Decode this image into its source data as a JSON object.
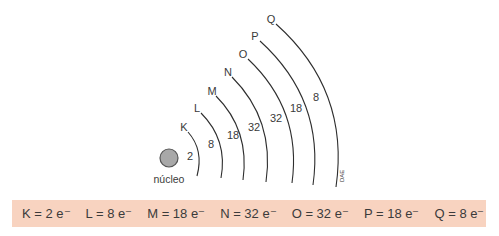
{
  "diagram": {
    "nucleus_label": "núcleo",
    "credit": "DAE",
    "nucleus_color": "#a8a8a8",
    "shells": [
      {
        "letter": "K",
        "electrons": "2"
      },
      {
        "letter": "L",
        "electrons": "8"
      },
      {
        "letter": "M",
        "electrons": "18"
      },
      {
        "letter": "N",
        "electrons": "32"
      },
      {
        "letter": "O",
        "electrons": "32"
      },
      {
        "letter": "P",
        "electrons": "18"
      },
      {
        "letter": "Q",
        "electrons": "8"
      }
    ]
  },
  "legend_strip": {
    "background": "#f8d3c0",
    "items": [
      "K = 2 e⁻",
      "L = 8 e⁻",
      "M = 18 e⁻",
      "N = 32 e⁻",
      "O = 32 e⁻",
      "P = 18 e⁻",
      "Q = 8 e⁻"
    ]
  }
}
